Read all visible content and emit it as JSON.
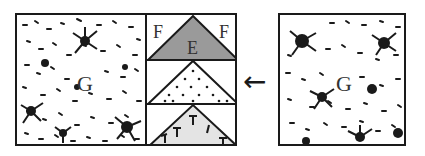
{
  "diagram": {
    "left_panel": {
      "label": "G",
      "texture": "rock-debris"
    },
    "middle_column": {
      "rows": [
        {
          "triangle_fill": "#9a9a9a",
          "triangle_label": "E",
          "corner_labels": [
            "F",
            "F"
          ],
          "pattern": "solid-gray"
        },
        {
          "triangle_fill": "#ffffff",
          "pattern": "dots"
        },
        {
          "triangle_fill": "#e4e4e4",
          "pattern": "plant-symbols"
        }
      ]
    },
    "arrow": {
      "direction": "left",
      "glyph": "←"
    },
    "right_panel": {
      "label": "G",
      "texture": "rock-debris"
    }
  },
  "colors": {
    "stroke": "#1a1a1a",
    "gray_fill": "#9a9a9a",
    "light_fill": "#e4e4e4"
  }
}
